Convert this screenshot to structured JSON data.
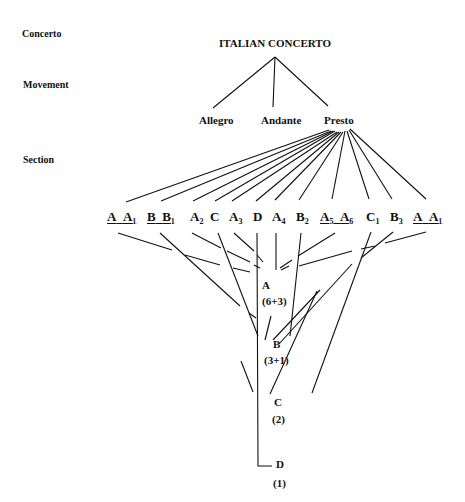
{
  "levels": {
    "concerto": "Concerto",
    "movement": "Movement",
    "section": "Section"
  },
  "title": "ITALIAN CONCERTO",
  "movements": [
    "Allegro",
    "Andante",
    "Presto"
  ],
  "sections": [
    {
      "parts": [
        {
          "base": "A",
          "sub": ""
        },
        {
          "base": "A",
          "sub": "1"
        }
      ],
      "underlined": true
    },
    {
      "parts": [
        {
          "base": "B",
          "sub": ""
        },
        {
          "base": "B",
          "sub": "1"
        }
      ],
      "underlined": true
    },
    {
      "parts": [
        {
          "base": "A",
          "sub": "2"
        }
      ],
      "underlined": false
    },
    {
      "parts": [
        {
          "base": "C",
          "sub": ""
        }
      ],
      "underlined": false
    },
    {
      "parts": [
        {
          "base": "A",
          "sub": "3"
        }
      ],
      "underlined": false
    },
    {
      "parts": [
        {
          "base": "D",
          "sub": ""
        }
      ],
      "underlined": false
    },
    {
      "parts": [
        {
          "base": "A",
          "sub": "4"
        }
      ],
      "underlined": false
    },
    {
      "parts": [
        {
          "base": "B",
          "sub": "2"
        }
      ],
      "underlined": false
    },
    {
      "parts": [
        {
          "base": "A",
          "sub": "5"
        },
        {
          "base": "A",
          "sub": "6"
        }
      ],
      "underlined": true
    },
    {
      "parts": [
        {
          "base": "C",
          "sub": "1"
        }
      ],
      "underlined": false
    },
    {
      "parts": [
        {
          "base": "B",
          "sub": "3"
        }
      ],
      "underlined": false
    },
    {
      "parts": [
        {
          "base": "A",
          "sub": ""
        },
        {
          "base": "A",
          "sub": "1"
        }
      ],
      "underlined": true
    }
  ],
  "groups": [
    {
      "label": "A",
      "count": "(6+3)"
    },
    {
      "label": "B",
      "count": "(3+1)"
    },
    {
      "label": "C",
      "count": "(2)"
    },
    {
      "label": "D",
      "count": "(1)"
    }
  ]
}
